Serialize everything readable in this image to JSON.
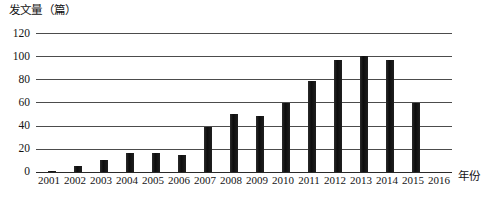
{
  "chart_data": {
    "type": "bar",
    "title": "",
    "ylabel": "发文量（篇）",
    "xlabel": "年份",
    "ylim": [
      0,
      120
    ],
    "yticks": [
      0,
      20,
      40,
      60,
      80,
      100,
      120
    ],
    "grid": true,
    "legend": "none",
    "categories": [
      "2001",
      "2002",
      "2003",
      "2004",
      "2005",
      "2006",
      "2007",
      "2008",
      "2009",
      "2010",
      "2011",
      "2012",
      "2013",
      "2014",
      "2015",
      "2016"
    ],
    "values": [
      1,
      5,
      10,
      16,
      16,
      15,
      39,
      50,
      48,
      60,
      79,
      97,
      100,
      97,
      60,
      0
    ]
  },
  "axes": {
    "y_title": "发文量（篇）",
    "x_title": "年份"
  }
}
